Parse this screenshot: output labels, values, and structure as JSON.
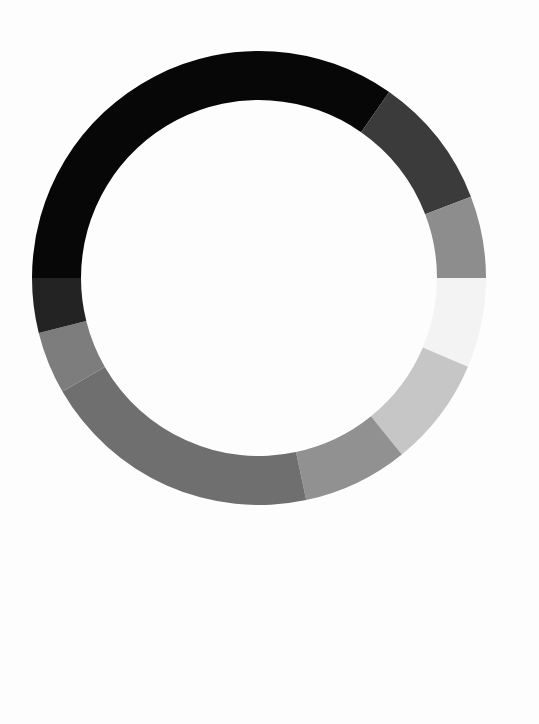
{
  "page": {
    "background_color": "#fdfdfd",
    "width": 539,
    "height": 724
  },
  "chart_data": {
    "type": "pie",
    "variant": "donut",
    "title": "",
    "subtitle": "",
    "xlabel": "",
    "ylabel": "",
    "legend": "none",
    "grid": false,
    "labels_shown": false,
    "geometry": {
      "center_x": 259,
      "center_y": 278,
      "outer_radius": 227,
      "inner_radius": 178,
      "ring_thickness": 49,
      "start_angle_deg": 180,
      "direction": "clockwise"
    },
    "categories": [
      "Segment 1",
      "Segment 2",
      "Segment 3",
      "Segment 4",
      "Segment 5",
      "Segment 6",
      "Segment 7",
      "Segment 8",
      "Segment 9"
    ],
    "values": [
      34.7,
      9.4,
      5.8,
      6.4,
      7.8,
      7.5,
      20.0,
      4.4,
      4.0
    ],
    "units": "percent",
    "total": 100,
    "colors": [
      "#070707",
      "#3b3b3b",
      "#8d8d8d",
      "#f3f3f3",
      "#c6c6c6",
      "#919191",
      "#6f6f6f",
      "#7d7d7d",
      "#232323"
    ],
    "segments": [
      {
        "label": "Segment 1",
        "value": 34.7,
        "color": "#070707",
        "start_deg": 180.0,
        "end_deg": 55.0
      },
      {
        "label": "Segment 2",
        "value": 9.4,
        "color": "#3b3b3b",
        "start_deg": 55.0,
        "end_deg": 21.0
      },
      {
        "label": "Segment 3",
        "value": 5.8,
        "color": "#8d8d8d",
        "start_deg": 21.0,
        "end_deg": 0.0
      },
      {
        "label": "Segment 4",
        "value": 6.4,
        "color": "#f3f3f3",
        "start_deg": 0.0,
        "end_deg": -23.0
      },
      {
        "label": "Segment 5",
        "value": 7.8,
        "color": "#c6c6c6",
        "start_deg": -23.0,
        "end_deg": -51.0
      },
      {
        "label": "Segment 6",
        "value": 7.5,
        "color": "#919191",
        "start_deg": -51.0,
        "end_deg": -78.0
      },
      {
        "label": "Segment 7",
        "value": 20.0,
        "color": "#6f6f6f",
        "start_deg": -78.0,
        "end_deg": -150.0
      },
      {
        "label": "Segment 8",
        "value": 4.4,
        "color": "#7d7d7d",
        "start_deg": -150.0,
        "end_deg": -166.0
      },
      {
        "label": "Segment 9",
        "value": 4.0,
        "color": "#232323",
        "start_deg": -166.0,
        "end_deg": -180.0
      }
    ]
  }
}
